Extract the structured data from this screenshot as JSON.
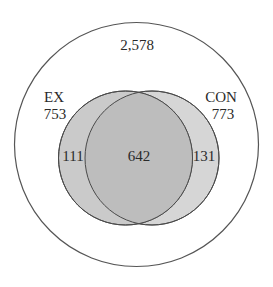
{
  "diagram": {
    "type": "venn",
    "universe": {
      "label": "2,578",
      "value": 2578
    },
    "sets": [
      {
        "name": "EX",
        "total": "753",
        "only": "111"
      },
      {
        "name": "CON",
        "total": "773",
        "only": "131"
      }
    ],
    "intersection": "642",
    "colors": {
      "outline": "#4a4a4a",
      "ex_fill": "#c9c9c9",
      "con_fill": "#d6d6d6",
      "overlap_fill": "#bdbdbd",
      "background": "#ffffff",
      "text": "#2a2a2a"
    }
  }
}
